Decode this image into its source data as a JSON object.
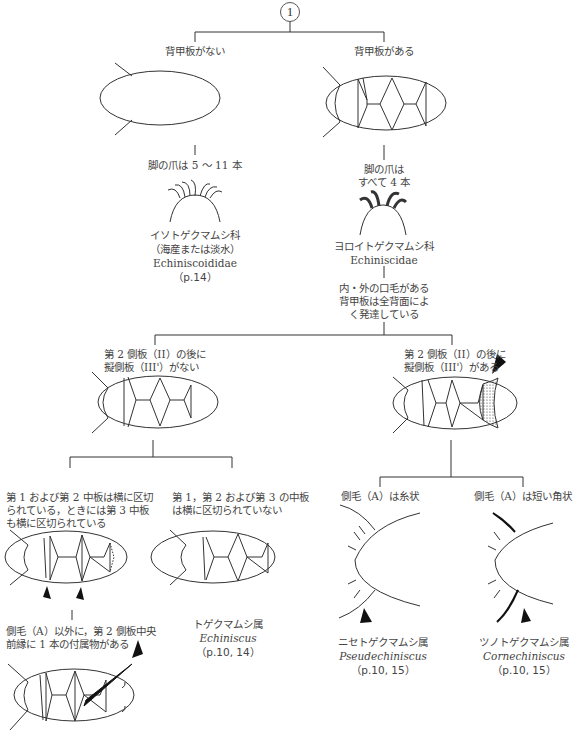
{
  "diagram": {
    "root": {
      "label": "1"
    },
    "level1": {
      "left": {
        "criterion": "背甲板がない",
        "claws": "脚の爪は 5 〜 11 本",
        "family_ja": "イソトゲクマムシ科",
        "habitat": "（海産または淡水）",
        "family_sci": "Echiniscoididae",
        "page": "（p.14）"
      },
      "right": {
        "criterion": "背甲板がある",
        "claws_line1": "脚の爪は",
        "claws_line2": "すべて 4 本",
        "family_ja": "ヨロイトゲクマムシ科",
        "family_sci": "Echiniscidae",
        "feature_line1": "内・外の口毛がある",
        "feature_line2": "背甲板は全背面によ",
        "feature_line3": "く発達している"
      }
    },
    "level2": {
      "left": {
        "line1": "第 2 側板（II）の後に",
        "line2": "擬側板（III'）がない"
      },
      "right": {
        "line1": "第 2 側板（II）の後に",
        "line2": "擬側板（III'）がある"
      }
    },
    "level3": {
      "ll": {
        "line1": "第 1 および第 2 中板は横に区切",
        "line2": "られている，ときには第 3 中板",
        "line3": "も横に区切られている",
        "note_line1": "側毛（A）以外に，第 2 側板中央",
        "note_line2": "前縁に 1 本の付属物がある"
      },
      "lr": {
        "line1": "第 1，第 2 および第 3 の中板",
        "line2": "は横に区切られていない",
        "genus_ja": "トゲクマムシ属",
        "genus_sci": "Echiniscus",
        "page": "（p.10, 14）"
      },
      "rl": {
        "criterion": "側毛（A）は糸状",
        "genus_ja": "ニセトゲクマムシ属",
        "genus_sci": "Pseudechiniscus",
        "page": "（p.10, 15）"
      },
      "rr": {
        "criterion": "側毛（A）は短い角状",
        "genus_ja": "ツノトゲクマムシ属",
        "genus_sci": "Cornechiniscus",
        "page": "（p.10, 15）"
      }
    }
  },
  "colors": {
    "line": "#333333",
    "text": "#444444",
    "background": "#ffffff"
  }
}
